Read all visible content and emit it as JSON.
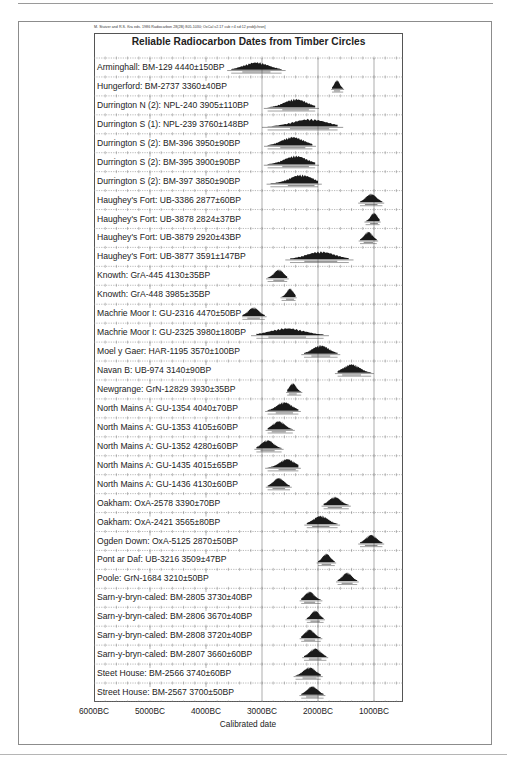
{
  "citation": "M. Stuiver and R.S. Kra eds. 1986 Radiocarbon 28(2B) 805-1030;  OxCal v2.17 cub r:4 sd:12 prob[chron]",
  "chart_data": {
    "type": "table",
    "subtype": "radiocarbon-probability-distributions",
    "title": "Reliable Radiocarbon Dates from Timber Circles",
    "xlabel": "Calibrated date",
    "ylabel": "",
    "x_ticks": [
      "6000BC",
      "5000BC",
      "4000BC",
      "3000BC",
      "2000BC",
      "1000BC"
    ],
    "x_tick_values_bc": [
      6000,
      5000,
      4000,
      3000,
      2000,
      1000
    ],
    "xlim_bc": [
      6000,
      500
    ],
    "grid": true,
    "rows": [
      {
        "site": "Arminghall",
        "lab": "BM-129",
        "bp": 4440,
        "err": 150,
        "label": "Arminghall: BM-129  4440±150BP",
        "range_bc": [
          3550,
          2650
        ],
        "center_bc": 3100
      },
      {
        "site": "Hungerford",
        "lab": "BM-2737",
        "bp": 3360,
        "err": 40,
        "label": "Hungerford: BM-2737  3360±40BP",
        "range_bc": [
          1750,
          1550
        ],
        "center_bc": 1660
      },
      {
        "site": "Durrington N (2)",
        "lab": "NPL-240",
        "bp": 3905,
        "err": 110,
        "label": "Durrington N (2): NPL-240  3905±110BP",
        "range_bc": [
          2900,
          2050
        ],
        "center_bc": 2400
      },
      {
        "site": "Durrington S (1)",
        "lab": "NPL-239",
        "bp": 3760,
        "err": 148,
        "label": "Durrington S (1): NPL-239  3760±148BP",
        "range_bc": [
          2900,
          1650
        ],
        "center_bc": 2150
      },
      {
        "site": "Durrington S (2)",
        "lab": "BM-396",
        "bp": 3950,
        "err": 90,
        "label": "Durrington S (2): BM-396  3950±90BP",
        "range_bc": [
          2900,
          2100
        ],
        "center_bc": 2450
      },
      {
        "site": "Durrington S (2)",
        "lab": "BM-395",
        "bp": 3900,
        "err": 90,
        "label": "Durrington S (2): BM-395  3900±90BP",
        "range_bc": [
          2900,
          2050
        ],
        "center_bc": 2400
      },
      {
        "site": "Durrington S (2)",
        "lab": "BM-397",
        "bp": 3850,
        "err": 90,
        "label": "Durrington S (2): BM-397  3850±90BP",
        "range_bc": [
          2850,
          2000
        ],
        "center_bc": 2300
      },
      {
        "site": "Haughey's Fort",
        "lab": "UB-3386",
        "bp": 2877,
        "err": 60,
        "label": "Haughey's Fort: UB-3386  2877±60BP",
        "range_bc": [
          1250,
          850
        ],
        "center_bc": 1050
      },
      {
        "site": "Haughey's Fort",
        "lab": "UB-3878",
        "bp": 2824,
        "err": 37,
        "label": "Haughey's Fort: UB-3878  2824±37BP",
        "range_bc": [
          1150,
          900
        ],
        "center_bc": 1000
      },
      {
        "site": "Haughey's Fort",
        "lab": "UB-3879",
        "bp": 2920,
        "err": 43,
        "label": "Haughey's Fort: UB-3879  2920±43BP",
        "range_bc": [
          1250,
          950
        ],
        "center_bc": 1100
      },
      {
        "site": "Haughey's Fort",
        "lab": "UB-3877",
        "bp": 3591,
        "err": 147,
        "label": "Haughey's Fort: UB-3877  3591±147BP",
        "range_bc": [
          2500,
          1450
        ],
        "center_bc": 1950
      },
      {
        "site": "Knowth",
        "lab": "GrA-445",
        "bp": 4130,
        "err": 35,
        "label": "Knowth: GrA-445  4130±35BP",
        "range_bc": [
          2900,
          2550
        ],
        "center_bc": 2700
      },
      {
        "site": "Knowth",
        "lab": "GrA-448",
        "bp": 3985,
        "err": 35,
        "label": "Knowth: GrA-448  3985±35BP",
        "range_bc": [
          2650,
          2400
        ],
        "center_bc": 2500
      },
      {
        "site": "Machrie Moor I",
        "lab": "GU-2316",
        "bp": 4470,
        "err": 50,
        "label": "Machrie Moor I: GU-2316  4470±50BP",
        "range_bc": [
          3350,
          2950
        ],
        "center_bc": 3150
      },
      {
        "site": "Machrie Moor I",
        "lab": "GU-2325",
        "bp": 3980,
        "err": 180,
        "label": "Machrie Moor I: GU-2325  3980±180BP",
        "range_bc": [
          3100,
          1900
        ],
        "center_bc": 2550
      },
      {
        "site": "Moel y Gaer",
        "lab": "HAR-1195",
        "bp": 3570,
        "err": 100,
        "label": "Moel y Gaer: HAR-1195  3570±100BP",
        "range_bc": [
          2250,
          1650
        ],
        "center_bc": 1950
      },
      {
        "site": "Navan B",
        "lab": "UB-974",
        "bp": 3140,
        "err": 90,
        "label": "Navan B: UB-974  3140±90BP",
        "range_bc": [
          1650,
          1050
        ],
        "center_bc": 1400
      },
      {
        "site": "Newgrange",
        "lab": "GrN-12829",
        "bp": 3930,
        "err": 35,
        "label": "Newgrange: GrN-12829  3930±35BP",
        "range_bc": [
          2550,
          2300
        ],
        "center_bc": 2450
      },
      {
        "site": "North Mains A",
        "lab": "GU-1354",
        "bp": 4040,
        "err": 70,
        "label": "North Mains A: GU-1354  4040±70BP",
        "range_bc": [
          2900,
          2350
        ],
        "center_bc": 2600
      },
      {
        "site": "North Mains A",
        "lab": "GU-1353",
        "bp": 4105,
        "err": 60,
        "label": "North Mains A: GU-1353  4105±60BP",
        "range_bc": [
          2900,
          2450
        ],
        "center_bc": 2700
      },
      {
        "site": "North Mains A",
        "lab": "GU-1352",
        "bp": 4280,
        "err": 60,
        "label": "North Mains A: GU-1352  4280±60BP",
        "range_bc": [
          3100,
          2650
        ],
        "center_bc": 2900
      },
      {
        "site": "North Mains A",
        "lab": "GU-1435",
        "bp": 4015,
        "err": 65,
        "label": "North Mains A: GU-1435  4015±65BP",
        "range_bc": [
          2900,
          2350
        ],
        "center_bc": 2550
      },
      {
        "site": "North Mains A",
        "lab": "GU-1436",
        "bp": 4130,
        "err": 60,
        "label": "North Mains A: GU-1436  4130±60BP",
        "range_bc": [
          2900,
          2500
        ],
        "center_bc": 2700
      },
      {
        "site": "Oakham",
        "lab": "OxA-2578",
        "bp": 3390,
        "err": 70,
        "label": "Oakham: OxA-2578  3390±70BP",
        "range_bc": [
          1900,
          1450
        ],
        "center_bc": 1700
      },
      {
        "site": "Oakham",
        "lab": "OxA-2421",
        "bp": 3565,
        "err": 80,
        "label": "Oakham: OxA-2421  3565±80BP",
        "range_bc": [
          2200,
          1650
        ],
        "center_bc": 1950
      },
      {
        "site": "Ogden Down",
        "lab": "OxA-5125",
        "bp": 2870,
        "err": 50,
        "label": "Ogden Down: OxA-5125  2870±50BP",
        "range_bc": [
          1250,
          850
        ],
        "center_bc": 1050
      },
      {
        "site": "Pont ar Daf",
        "lab": "UB-3216",
        "bp": 3509,
        "err": 47,
        "label": "Pont ar Daf: UB-3216  3509±47BP",
        "range_bc": [
          2000,
          1700
        ],
        "center_bc": 1850
      },
      {
        "site": "Poole",
        "lab": "GrN-1684",
        "bp": 3210,
        "err": 50,
        "label": "Poole: GrN-1684  3210±50BP",
        "range_bc": [
          1650,
          1300
        ],
        "center_bc": 1480
      },
      {
        "site": "Sarn-y-bryn-caled",
        "lab": "BM-2805",
        "bp": 3730,
        "err": 40,
        "label": "Sarn-y-bryn-caled: BM-2805  3730±40BP",
        "range_bc": [
          2300,
          1950
        ],
        "center_bc": 2150
      },
      {
        "site": "Sarn-y-bryn-caled",
        "lab": "BM-2806",
        "bp": 3670,
        "err": 40,
        "label": "Sarn-y-bryn-caled: BM-2806  3670±40BP",
        "range_bc": [
          2200,
          1900
        ],
        "center_bc": 2050
      },
      {
        "site": "Sarn-y-bryn-caled",
        "lab": "BM-2808",
        "bp": 3720,
        "err": 40,
        "label": "Sarn-y-bryn-caled: BM-2808  3720±40BP",
        "range_bc": [
          2300,
          1950
        ],
        "center_bc": 2150
      },
      {
        "site": "Sarn-y-bryn-caled",
        "lab": "BM-2807",
        "bp": 3660,
        "err": 60,
        "label": "Sarn-y-bryn-caled: BM-2807  3660±60BP",
        "range_bc": [
          2250,
          1850
        ],
        "center_bc": 2050
      },
      {
        "site": "Steet House",
        "lab": "BM-2566",
        "bp": 3740,
        "err": 60,
        "label": "Steet House: BM-2566  3740±60BP",
        "range_bc": [
          2400,
          1950
        ],
        "center_bc": 2150
      },
      {
        "site": "Street House",
        "lab": "BM-2567",
        "bp": 3700,
        "err": 50,
        "label": "Street House: BM-2567  3700±50BP",
        "range_bc": [
          2300,
          1900
        ],
        "center_bc": 2100
      }
    ]
  },
  "layout": {
    "plot_left_px": 94,
    "plot_width_px": 309,
    "first_row_top_px": 58,
    "row_height_px": 18.94,
    "px_per_1000_years": 56,
    "ink_color": "#1a1a1a",
    "grid_color": "#8a8a8a"
  }
}
